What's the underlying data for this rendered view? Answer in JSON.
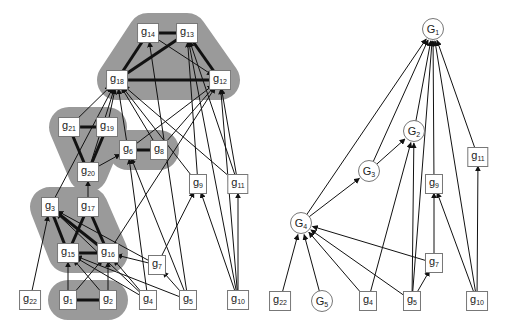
{
  "figure": {
    "left_panel": {
      "clusters": [
        {
          "id": "c1",
          "members": [
            "g14",
            "g13",
            "g18",
            "g12"
          ]
        },
        {
          "id": "c2",
          "members": [
            "g21",
            "g19",
            "g20"
          ]
        },
        {
          "id": "c3",
          "members": [
            "g6",
            "g8"
          ]
        },
        {
          "id": "c4",
          "members": [
            "g3",
            "g17",
            "g15",
            "g16"
          ]
        },
        {
          "id": "c5",
          "members": [
            "g1",
            "g2"
          ]
        }
      ],
      "nodes": [
        {
          "id": "g14",
          "base": "g",
          "sub": "14",
          "x": 148,
          "y": 33
        },
        {
          "id": "g13",
          "base": "g",
          "sub": "13",
          "x": 187,
          "y": 33
        },
        {
          "id": "g18",
          "base": "g",
          "sub": "18",
          "x": 117,
          "y": 80
        },
        {
          "id": "g12",
          "base": "g",
          "sub": "12",
          "x": 220,
          "y": 80
        },
        {
          "id": "g21",
          "base": "g",
          "sub": "21",
          "x": 69,
          "y": 127
        },
        {
          "id": "g19",
          "base": "g",
          "sub": "19",
          "x": 107,
          "y": 127
        },
        {
          "id": "g6",
          "base": "g",
          "sub": "6",
          "x": 128,
          "y": 150
        },
        {
          "id": "g8",
          "base": "g",
          "sub": "8",
          "x": 159,
          "y": 150
        },
        {
          "id": "g20",
          "base": "g",
          "sub": "20",
          "x": 88,
          "y": 172
        },
        {
          "id": "g9",
          "base": "g",
          "sub": "9",
          "x": 198,
          "y": 184
        },
        {
          "id": "g11",
          "base": "g",
          "sub": "11",
          "x": 238,
          "y": 184
        },
        {
          "id": "g3",
          "base": "g",
          "sub": "3",
          "x": 50,
          "y": 207
        },
        {
          "id": "g17",
          "base": "g",
          "sub": "17",
          "x": 88,
          "y": 207
        },
        {
          "id": "g15",
          "base": "g",
          "sub": "15",
          "x": 68,
          "y": 253
        },
        {
          "id": "g16",
          "base": "g",
          "sub": "16",
          "x": 108,
          "y": 253
        },
        {
          "id": "g7",
          "base": "g",
          "sub": "7",
          "x": 157,
          "y": 265
        },
        {
          "id": "g22",
          "base": "g",
          "sub": "22",
          "x": 30,
          "y": 300
        },
        {
          "id": "g1",
          "base": "g",
          "sub": "1",
          "x": 68,
          "y": 300
        },
        {
          "id": "g2",
          "base": "g",
          "sub": "2",
          "x": 108,
          "y": 300
        },
        {
          "id": "g4",
          "base": "g",
          "sub": "4",
          "x": 148,
          "y": 300
        },
        {
          "id": "g5",
          "base": "g",
          "sub": "5",
          "x": 188,
          "y": 300
        },
        {
          "id": "g10",
          "base": "g",
          "sub": "10",
          "x": 238,
          "y": 300
        }
      ],
      "undirected_thick": [
        [
          "g14",
          "g13"
        ],
        [
          "g14",
          "g18"
        ],
        [
          "g13",
          "g18"
        ],
        [
          "g13",
          "g12"
        ],
        [
          "g18",
          "g12"
        ],
        [
          "g21",
          "g19"
        ],
        [
          "g21",
          "g20"
        ],
        [
          "g19",
          "g20"
        ],
        [
          "g6",
          "g8"
        ],
        [
          "g3",
          "g15"
        ],
        [
          "g3",
          "g16"
        ],
        [
          "g17",
          "g15"
        ],
        [
          "g17",
          "g16"
        ],
        [
          "g15",
          "g16"
        ],
        [
          "g1",
          "g2"
        ]
      ],
      "directed": [
        [
          "g14",
          "g12"
        ],
        [
          "g21",
          "g18"
        ],
        [
          "g19",
          "g18"
        ],
        [
          "g20",
          "g18"
        ],
        [
          "g6",
          "g18"
        ],
        [
          "g8",
          "g18"
        ],
        [
          "g6",
          "g12"
        ],
        [
          "g8",
          "g12"
        ],
        [
          "g20",
          "g6"
        ],
        [
          "g17",
          "g20"
        ],
        [
          "g3",
          "g18"
        ],
        [
          "g9",
          "g18"
        ],
        [
          "g9",
          "g13"
        ],
        [
          "g11",
          "g18"
        ],
        [
          "g11",
          "g13"
        ],
        [
          "g11",
          "g12"
        ],
        [
          "g10",
          "g13"
        ],
        [
          "g10",
          "g12"
        ],
        [
          "g10",
          "g9"
        ],
        [
          "g10",
          "g11"
        ],
        [
          "g5",
          "g14"
        ],
        [
          "g16",
          "g12"
        ],
        [
          "g4",
          "g6"
        ],
        [
          "g5",
          "g6"
        ],
        [
          "g22",
          "g3"
        ],
        [
          "g7",
          "g3"
        ],
        [
          "g7",
          "g16"
        ],
        [
          "g7",
          "g9"
        ],
        [
          "g1",
          "g15"
        ],
        [
          "g1",
          "g16"
        ],
        [
          "g2",
          "g15"
        ],
        [
          "g2",
          "g16"
        ],
        [
          "g4",
          "g15"
        ],
        [
          "g4",
          "g16"
        ],
        [
          "g5",
          "g15"
        ],
        [
          "g5",
          "g7"
        ],
        [
          "g4",
          "g3"
        ]
      ]
    },
    "right_panel": {
      "nodes": [
        {
          "id": "G1",
          "base": "G",
          "sub": "1",
          "x": 433,
          "y": 29,
          "shape": "circle"
        },
        {
          "id": "G2",
          "base": "G",
          "sub": "2",
          "x": 414,
          "y": 131,
          "shape": "circle"
        },
        {
          "id": "G3",
          "base": "G",
          "sub": "3",
          "x": 369,
          "y": 171,
          "shape": "circle"
        },
        {
          "id": "G4",
          "base": "G",
          "sub": "4",
          "x": 301,
          "y": 223,
          "shape": "circle"
        },
        {
          "id": "G5",
          "base": "G",
          "sub": "5",
          "x": 322,
          "y": 301,
          "shape": "circle"
        },
        {
          "id": "g11r",
          "base": "g",
          "sub": "11",
          "x": 478,
          "y": 157,
          "shape": "box"
        },
        {
          "id": "g9r",
          "base": "g",
          "sub": "9",
          "x": 434,
          "y": 184,
          "shape": "box"
        },
        {
          "id": "g7r",
          "base": "g",
          "sub": "7",
          "x": 434,
          "y": 263,
          "shape": "box"
        },
        {
          "id": "g22r",
          "base": "g",
          "sub": "22",
          "x": 280,
          "y": 301,
          "shape": "box"
        },
        {
          "id": "g4r",
          "base": "g",
          "sub": "4",
          "x": 368,
          "y": 301,
          "shape": "box"
        },
        {
          "id": "g5r",
          "base": "g",
          "sub": "5",
          "x": 412,
          "y": 301,
          "shape": "box"
        },
        {
          "id": "g10r",
          "base": "g",
          "sub": "10",
          "x": 477,
          "y": 301,
          "shape": "box"
        }
      ],
      "directed": [
        [
          "G4",
          "G1"
        ],
        [
          "G3",
          "G1"
        ],
        [
          "G2",
          "G1"
        ],
        [
          "g9r",
          "G1"
        ],
        [
          "g11r",
          "G1"
        ],
        [
          "g10r",
          "G1"
        ],
        [
          "g5r",
          "G1"
        ],
        [
          "G3",
          "G2"
        ],
        [
          "g4r",
          "G2"
        ],
        [
          "g5r",
          "G2"
        ],
        [
          "G4",
          "G3"
        ],
        [
          "g22r",
          "G4"
        ],
        [
          "G5",
          "G4"
        ],
        [
          "g4r",
          "G4"
        ],
        [
          "g5r",
          "G4"
        ],
        [
          "g7r",
          "G4"
        ],
        [
          "g5r",
          "g7r"
        ],
        [
          "g7r",
          "g9r"
        ],
        [
          "g10r",
          "g9r"
        ],
        [
          "g10r",
          "g11r"
        ]
      ]
    },
    "colors": {
      "cluster_fill": "#9a9a9a",
      "edge": "#111111",
      "node_border": "#777777",
      "node_fill": "#ffffff"
    }
  }
}
